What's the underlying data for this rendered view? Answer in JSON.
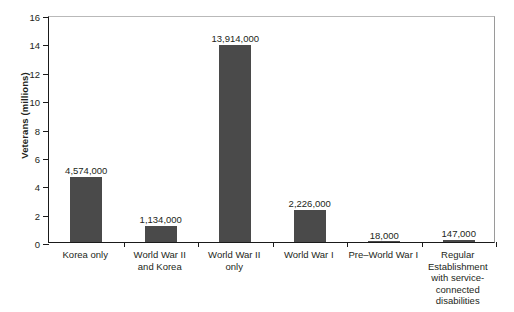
{
  "chart_data": {
    "type": "bar",
    "title": "",
    "xlabel": "",
    "ylabel": "Veterans (millions)",
    "ylim": [
      0,
      16
    ],
    "ytick_values": [
      0,
      2,
      4,
      6,
      8,
      10,
      12,
      14,
      16
    ],
    "ytick_labels": [
      "0",
      "2",
      "4",
      "6",
      "8",
      "10",
      "12",
      "14",
      "16"
    ],
    "grid": false,
    "legend": null,
    "bar_color": "#4a4a4a",
    "categories": [
      "Korea only",
      "World War II and Korea",
      "World War II only",
      "World War I",
      "Pre–World War I",
      "Regular Establishment with service-connected disabilities"
    ],
    "category_label_lines": [
      [
        "Korea only"
      ],
      [
        "World War II",
        "and Korea"
      ],
      [
        "World War II",
        "only"
      ],
      [
        "World War I"
      ],
      [
        "Pre–World War I"
      ],
      [
        "Regular",
        "Establishment",
        "with service-",
        "connected",
        "disabilities"
      ]
    ],
    "values": [
      4.574,
      1.134,
      13.914,
      2.226,
      0.018,
      0.147
    ],
    "value_labels": [
      "4,574,000",
      "1,134,000",
      "13,914,000",
      "2,226,000",
      "18,000",
      "147,000"
    ]
  }
}
